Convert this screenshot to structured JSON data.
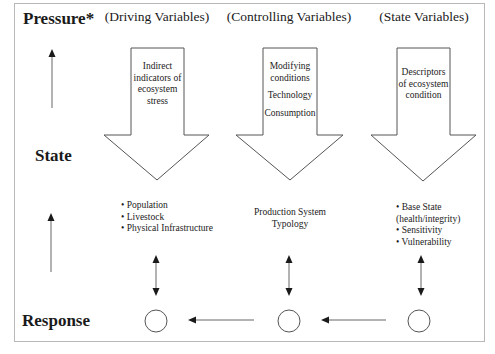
{
  "row_labels": {
    "pressure": "Pressure*",
    "state": "State",
    "response": "Response"
  },
  "columns": [
    {
      "heading": "(Driving Variables)",
      "arrow_text": [
        "Indirect",
        "indicators of",
        "ecosystem",
        "stress"
      ],
      "below_items": [
        "• Population",
        "• Livestock",
        "• Physical Infrastructure"
      ]
    },
    {
      "heading": "(Controlling Variables)",
      "arrow_text": [
        "Modifying",
        "conditions",
        "Technology",
        "Consumption"
      ],
      "below_items": [
        "Production System",
        "Typology"
      ]
    },
    {
      "heading": "(State Variables)",
      "arrow_text": [
        "Descriptors",
        "of ecosystem",
        "condition"
      ],
      "below_items": [
        "• Base State",
        "(health/integrity)",
        "• Sensitivity",
        "• Vulnerability"
      ]
    }
  ],
  "icons": {
    "left_axis_arrows": "up-arrow",
    "big_arrows": "block-down-arrow",
    "link_arrows": "double-headed-vertical-arrow",
    "response_nodes": "circle",
    "flow_arrows": "left-arrow"
  },
  "colors": {
    "stroke": "#555555",
    "frame": "#b8b8b8",
    "text": "#1a1a1a",
    "background": "#ffffff"
  }
}
